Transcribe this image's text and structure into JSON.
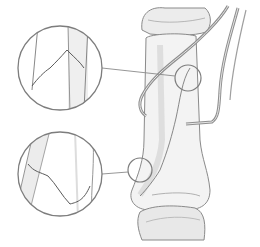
{
  "figure": {
    "colors": {
      "background": "#ffffff",
      "outline": "#8a8a8a",
      "bone_fill": "#f2f2f2",
      "bone_shade": "#e0e0e0",
      "instrument": "#9a9a9a",
      "callout_circle": "#7d7d7d"
    },
    "callouts": [
      {
        "id": "upper",
        "label": ""
      },
      {
        "id": "lower",
        "label": ""
      }
    ]
  }
}
